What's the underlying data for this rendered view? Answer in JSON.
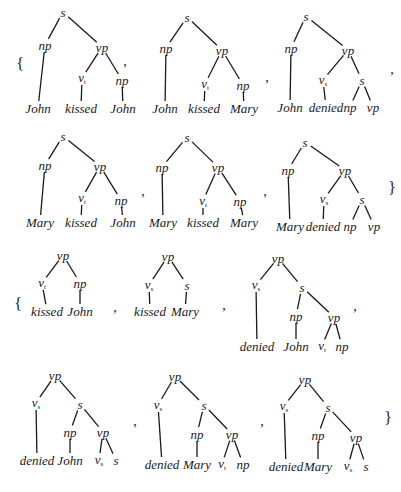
{
  "figure": {
    "line_color": "#1a1a1a",
    "set_open": "{",
    "set_close": "}",
    "separator": ","
  },
  "punctuation": [
    {
      "type": "open",
      "text": "{",
      "x": 20,
      "y": 64
    },
    {
      "type": "comma",
      "text": ",",
      "x": 125,
      "y": 62
    },
    {
      "type": "comma",
      "text": ",",
      "x": 267,
      "y": 78
    },
    {
      "type": "comma",
      "text": ",",
      "x": 392,
      "y": 70
    },
    {
      "type": "comma",
      "text": ",",
      "x": 143,
      "y": 192
    },
    {
      "type": "comma",
      "text": ",",
      "x": 265,
      "y": 192
    },
    {
      "type": "close",
      "text": "}",
      "x": 392,
      "y": 188
    },
    {
      "type": "open",
      "text": "{",
      "x": 18,
      "y": 304
    },
    {
      "type": "comma",
      "text": ",",
      "x": 115,
      "y": 308
    },
    {
      "type": "comma",
      "text": ",",
      "x": 224,
      "y": 306
    },
    {
      "type": "comma",
      "text": ",",
      "x": 355,
      "y": 307
    },
    {
      "type": "comma",
      "text": ",",
      "x": 135,
      "y": 422
    },
    {
      "type": "comma",
      "text": ",",
      "x": 262,
      "y": 422
    },
    {
      "type": "close",
      "text": "}",
      "x": 388,
      "y": 418
    }
  ],
  "trees": [
    {
      "id": "t1",
      "set": 1,
      "nodes": [
        {
          "id": "s",
          "label": "s",
          "x": 63,
          "y": 12
        },
        {
          "id": "np",
          "label": "np",
          "x": 45,
          "y": 45
        },
        {
          "id": "vp",
          "label": "vp",
          "x": 102,
          "y": 47
        },
        {
          "id": "v",
          "label": "v",
          "sub": "t",
          "x": 82,
          "y": 78
        },
        {
          "id": "np2",
          "label": "np",
          "x": 122,
          "y": 80
        },
        {
          "id": "w1",
          "label": "John",
          "x": 38,
          "y": 108
        },
        {
          "id": "w2",
          "label": "kissed",
          "x": 81,
          "y": 108
        },
        {
          "id": "w3",
          "label": "John",
          "x": 123,
          "y": 108
        }
      ],
      "edges": [
        [
          "s",
          "np"
        ],
        [
          "s",
          "vp"
        ],
        [
          "np",
          "w1"
        ],
        [
          "vp",
          "v"
        ],
        [
          "vp",
          "np2"
        ],
        [
          "v",
          "w2"
        ],
        [
          "np2",
          "w3"
        ]
      ]
    },
    {
      "id": "t2",
      "set": 1,
      "nodes": [
        {
          "id": "s",
          "label": "s",
          "x": 187,
          "y": 17
        },
        {
          "id": "np",
          "label": "np",
          "x": 166,
          "y": 48
        },
        {
          "id": "vp",
          "label": "vp",
          "x": 222,
          "y": 50
        },
        {
          "id": "v",
          "label": "v",
          "sub": "t",
          "x": 205,
          "y": 84
        },
        {
          "id": "np2",
          "label": "np",
          "x": 243,
          "y": 85
        },
        {
          "id": "w1",
          "label": "John",
          "x": 165,
          "y": 108
        },
        {
          "id": "w2",
          "label": "kissed",
          "x": 204,
          "y": 108
        },
        {
          "id": "w3",
          "label": "Mary",
          "x": 244,
          "y": 108
        }
      ],
      "edges": [
        [
          "s",
          "np"
        ],
        [
          "s",
          "vp"
        ],
        [
          "np",
          "w1"
        ],
        [
          "vp",
          "v"
        ],
        [
          "vp",
          "np2"
        ],
        [
          "v",
          "w2"
        ],
        [
          "np2",
          "w3"
        ]
      ]
    },
    {
      "id": "t3",
      "set": 1,
      "nodes": [
        {
          "id": "s",
          "label": "s",
          "x": 306,
          "y": 16
        },
        {
          "id": "np",
          "label": "np",
          "x": 291,
          "y": 48
        },
        {
          "id": "vp",
          "label": "vp",
          "x": 348,
          "y": 50
        },
        {
          "id": "v",
          "label": "v",
          "sub": "s",
          "x": 323,
          "y": 80
        },
        {
          "id": "s2",
          "label": "s",
          "x": 362,
          "y": 80
        },
        {
          "id": "w1",
          "label": "John",
          "x": 290,
          "y": 107
        },
        {
          "id": "w2",
          "label": "denied",
          "x": 326,
          "y": 107
        },
        {
          "id": "np2",
          "label": "np",
          "x": 350,
          "y": 107
        },
        {
          "id": "vp2",
          "label": "vp",
          "x": 373,
          "y": 107
        }
      ],
      "edges": [
        [
          "s",
          "np"
        ],
        [
          "s",
          "vp"
        ],
        [
          "np",
          "w1"
        ],
        [
          "vp",
          "v"
        ],
        [
          "vp",
          "s2"
        ],
        [
          "v",
          "w2"
        ],
        [
          "s2",
          "np2"
        ],
        [
          "s2",
          "vp2"
        ]
      ]
    },
    {
      "id": "t4",
      "set": 1,
      "nodes": [
        {
          "id": "s",
          "label": "s",
          "x": 63,
          "y": 136
        },
        {
          "id": "np",
          "label": "np",
          "x": 45,
          "y": 165
        },
        {
          "id": "vp",
          "label": "vp",
          "x": 100,
          "y": 166
        },
        {
          "id": "v",
          "label": "v",
          "sub": "t",
          "x": 82,
          "y": 198
        },
        {
          "id": "np2",
          "label": "np",
          "x": 121,
          "y": 200
        },
        {
          "id": "w1",
          "label": "Mary",
          "x": 40,
          "y": 222
        },
        {
          "id": "w2",
          "label": "kissed",
          "x": 81,
          "y": 222
        },
        {
          "id": "w3",
          "label": "John",
          "x": 123,
          "y": 222
        }
      ],
      "edges": [
        [
          "s",
          "np"
        ],
        [
          "s",
          "vp"
        ],
        [
          "np",
          "w1"
        ],
        [
          "vp",
          "v"
        ],
        [
          "vp",
          "np2"
        ],
        [
          "v",
          "w2"
        ],
        [
          "np2",
          "w3"
        ]
      ]
    },
    {
      "id": "t5",
      "set": 1,
      "nodes": [
        {
          "id": "s",
          "label": "s",
          "x": 187,
          "y": 137
        },
        {
          "id": "np",
          "label": "np",
          "x": 162,
          "y": 167
        },
        {
          "id": "vp",
          "label": "vp",
          "x": 218,
          "y": 167
        },
        {
          "id": "v",
          "label": "v",
          "sub": "t",
          "x": 203,
          "y": 201
        },
        {
          "id": "np2",
          "label": "np",
          "x": 240,
          "y": 201
        },
        {
          "id": "w1",
          "label": "Mary",
          "x": 163,
          "y": 222
        },
        {
          "id": "w2",
          "label": "kissed",
          "x": 203,
          "y": 222
        },
        {
          "id": "w3",
          "label": "Mary",
          "x": 244,
          "y": 222
        }
      ],
      "edges": [
        [
          "s",
          "np"
        ],
        [
          "s",
          "vp"
        ],
        [
          "np",
          "w1"
        ],
        [
          "vp",
          "v"
        ],
        [
          "vp",
          "np2"
        ],
        [
          "v",
          "w2"
        ],
        [
          "np2",
          "w3"
        ]
      ]
    },
    {
      "id": "t6",
      "set": 1,
      "nodes": [
        {
          "id": "s",
          "label": "s",
          "x": 305,
          "y": 142
        },
        {
          "id": "np",
          "label": "np",
          "x": 288,
          "y": 170
        },
        {
          "id": "vp",
          "label": "vp",
          "x": 345,
          "y": 170
        },
        {
          "id": "v",
          "label": "v",
          "sub": "s",
          "x": 324,
          "y": 199
        },
        {
          "id": "s2",
          "label": "s",
          "x": 362,
          "y": 199
        },
        {
          "id": "w1",
          "label": "Mary",
          "x": 290,
          "y": 226
        },
        {
          "id": "w2",
          "label": "denied",
          "x": 323,
          "y": 226
        },
        {
          "id": "np2",
          "label": "np",
          "x": 350,
          "y": 226
        },
        {
          "id": "vp2",
          "label": "vp",
          "x": 374,
          "y": 226
        }
      ],
      "edges": [
        [
          "s",
          "np"
        ],
        [
          "s",
          "vp"
        ],
        [
          "np",
          "w1"
        ],
        [
          "vp",
          "v"
        ],
        [
          "vp",
          "s2"
        ],
        [
          "v",
          "w2"
        ],
        [
          "s2",
          "np2"
        ],
        [
          "s2",
          "vp2"
        ]
      ]
    },
    {
      "id": "t7",
      "set": 2,
      "nodes": [
        {
          "id": "vp",
          "label": "vp",
          "x": 63,
          "y": 255
        },
        {
          "id": "v",
          "label": "v",
          "sub": "t",
          "x": 42,
          "y": 283
        },
        {
          "id": "np",
          "label": "np",
          "x": 80,
          "y": 283
        },
        {
          "id": "w1",
          "label": "kissed",
          "x": 47,
          "y": 311
        },
        {
          "id": "w2",
          "label": "John",
          "x": 80,
          "y": 311
        }
      ],
      "edges": [
        [
          "vp",
          "v"
        ],
        [
          "vp",
          "np"
        ],
        [
          "v",
          "w1"
        ],
        [
          "np",
          "w2"
        ]
      ]
    },
    {
      "id": "t8",
      "set": 2,
      "nodes": [
        {
          "id": "vp",
          "label": "vp",
          "x": 168,
          "y": 256
        },
        {
          "id": "v",
          "label": "v",
          "sub": "s",
          "x": 149,
          "y": 285
        },
        {
          "id": "s",
          "label": "s",
          "x": 187,
          "y": 285
        },
        {
          "id": "w1",
          "label": "kissed",
          "x": 150,
          "y": 311
        },
        {
          "id": "w2",
          "label": "Mary",
          "x": 185,
          "y": 311
        }
      ],
      "edges": [
        [
          "vp",
          "v"
        ],
        [
          "vp",
          "s"
        ],
        [
          "v",
          "w1"
        ],
        [
          "s",
          "w2"
        ]
      ]
    },
    {
      "id": "t9",
      "set": 2,
      "nodes": [
        {
          "id": "vp",
          "label": "vp",
          "x": 278,
          "y": 258
        },
        {
          "id": "v",
          "label": "v",
          "sub": "s",
          "x": 256,
          "y": 285
        },
        {
          "id": "s",
          "label": "s",
          "x": 302,
          "y": 287
        },
        {
          "id": "np",
          "label": "np",
          "x": 296,
          "y": 316
        },
        {
          "id": "vp2",
          "label": "vp",
          "x": 334,
          "y": 317
        },
        {
          "id": "w1",
          "label": "denied",
          "x": 257,
          "y": 346
        },
        {
          "id": "w2",
          "label": "John",
          "x": 296,
          "y": 346
        },
        {
          "id": "v2",
          "label": "v",
          "sub": "t",
          "x": 322,
          "y": 346
        },
        {
          "id": "np2",
          "label": "np",
          "x": 342,
          "y": 346
        }
      ],
      "edges": [
        [
          "vp",
          "v"
        ],
        [
          "vp",
          "s"
        ],
        [
          "v",
          "w1"
        ],
        [
          "s",
          "np"
        ],
        [
          "s",
          "vp2"
        ],
        [
          "np",
          "w2"
        ],
        [
          "vp2",
          "v2"
        ],
        [
          "vp2",
          "np2"
        ]
      ]
    },
    {
      "id": "t10",
      "set": 2,
      "nodes": [
        {
          "id": "vp",
          "label": "vp",
          "x": 55,
          "y": 375
        },
        {
          "id": "v",
          "label": "v",
          "sub": "s",
          "x": 36,
          "y": 403
        },
        {
          "id": "s",
          "label": "s",
          "x": 80,
          "y": 404
        },
        {
          "id": "np",
          "label": "np",
          "x": 70,
          "y": 432
        },
        {
          "id": "vp2",
          "label": "vp",
          "x": 103,
          "y": 432
        },
        {
          "id": "w1",
          "label": "denied",
          "x": 37,
          "y": 460
        },
        {
          "id": "w2",
          "label": "John",
          "x": 70,
          "y": 460
        },
        {
          "id": "v2",
          "label": "v",
          "sub": "s",
          "x": 99,
          "y": 460
        },
        {
          "id": "s2",
          "label": "s",
          "x": 116,
          "y": 460
        }
      ],
      "edges": [
        [
          "vp",
          "v"
        ],
        [
          "vp",
          "s"
        ],
        [
          "v",
          "w1"
        ],
        [
          "s",
          "np"
        ],
        [
          "s",
          "vp2"
        ],
        [
          "np",
          "w2"
        ],
        [
          "vp2",
          "v2"
        ],
        [
          "vp2",
          "s2"
        ]
      ]
    },
    {
      "id": "t11",
      "set": 2,
      "nodes": [
        {
          "id": "vp",
          "label": "vp",
          "x": 175,
          "y": 376
        },
        {
          "id": "v",
          "label": "v",
          "sub": "s",
          "x": 158,
          "y": 405
        },
        {
          "id": "s",
          "label": "s",
          "x": 204,
          "y": 405
        },
        {
          "id": "np",
          "label": "np",
          "x": 197,
          "y": 434
        },
        {
          "id": "vp2",
          "label": "vp",
          "x": 232,
          "y": 434
        },
        {
          "id": "w1",
          "label": "denied",
          "x": 162,
          "y": 464
        },
        {
          "id": "w2",
          "label": "Mary",
          "x": 197,
          "y": 464
        },
        {
          "id": "v2",
          "label": "v",
          "sub": "t",
          "x": 222,
          "y": 464
        },
        {
          "id": "np2",
          "label": "np",
          "x": 243,
          "y": 464
        }
      ],
      "edges": [
        [
          "vp",
          "v"
        ],
        [
          "vp",
          "s"
        ],
        [
          "v",
          "w1"
        ],
        [
          "s",
          "np"
        ],
        [
          "s",
          "vp2"
        ],
        [
          "np",
          "w2"
        ],
        [
          "vp2",
          "v2"
        ],
        [
          "vp2",
          "np2"
        ]
      ]
    },
    {
      "id": "t12",
      "set": 2,
      "nodes": [
        {
          "id": "vp",
          "label": "vp",
          "x": 305,
          "y": 379
        },
        {
          "id": "v",
          "label": "v",
          "sub": "s",
          "x": 284,
          "y": 406
        },
        {
          "id": "s",
          "label": "s",
          "x": 328,
          "y": 407
        },
        {
          "id": "np",
          "label": "np",
          "x": 318,
          "y": 435
        },
        {
          "id": "vp2",
          "label": "vp",
          "x": 356,
          "y": 437
        },
        {
          "id": "w1",
          "label": "denied",
          "x": 286,
          "y": 466
        },
        {
          "id": "w2",
          "label": "Mary",
          "x": 318,
          "y": 466
        },
        {
          "id": "v2",
          "label": "v",
          "sub": "s",
          "x": 348,
          "y": 466
        },
        {
          "id": "s2",
          "label": "s",
          "x": 366,
          "y": 466
        }
      ],
      "edges": [
        [
          "vp",
          "v"
        ],
        [
          "vp",
          "s"
        ],
        [
          "v",
          "w1"
        ],
        [
          "s",
          "np"
        ],
        [
          "s",
          "vp2"
        ],
        [
          "np",
          "w2"
        ],
        [
          "vp2",
          "v2"
        ],
        [
          "vp2",
          "s2"
        ]
      ]
    }
  ]
}
